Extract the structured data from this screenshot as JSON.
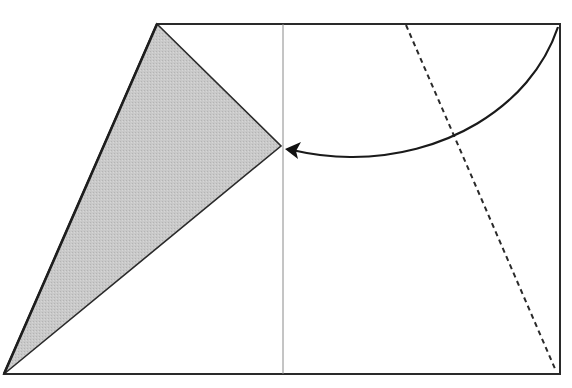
{
  "diagram": {
    "type": "paper-folding-step",
    "width": 572,
    "height": 388,
    "colors": {
      "background": "#ffffff",
      "outline": "#2a2a2a",
      "center_line": "#8a8a8a",
      "fold_line": "#2a2a2a",
      "shaded_fill": "#c4c4c4",
      "arrow": "#1a1a1a"
    },
    "paper_outline": {
      "label": "paper-outline",
      "points": [
        [
          4,
          374
        ],
        [
          157,
          24
        ],
        [
          560,
          24
        ],
        [
          560,
          374
        ]
      ]
    },
    "shaded_flap": {
      "label": "folded-flap",
      "points": [
        [
          157,
          24
        ],
        [
          281,
          146
        ],
        [
          4,
          374
        ]
      ]
    },
    "center_crease": {
      "label": "vertical-crease",
      "x1": 283,
      "y1": 24,
      "x2": 283,
      "y2": 374
    },
    "valley_fold": {
      "label": "dashed-fold-line",
      "x1": 406,
      "y1": 25,
      "x2": 556,
      "y2": 371,
      "dash": "5,4"
    },
    "fold_arrow": {
      "label": "fold-direction-arrow",
      "path": "M 558 27 C 530 110, 440 158, 350 157 C 325 157, 305 153, 292 150",
      "tip": [
        285,
        149
      ]
    }
  }
}
